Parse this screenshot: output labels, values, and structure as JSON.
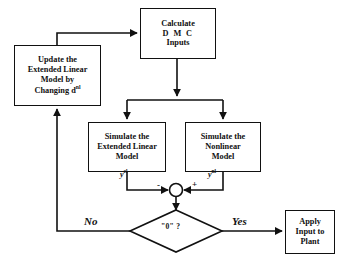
{
  "diagram": {
    "type": "flowchart",
    "line_color": "#111111",
    "background_color": "#ffffff",
    "nodes": {
      "calculate": {
        "shape": "rectangle",
        "lines": [
          "Calculate",
          "D M C",
          "Inputs"
        ]
      },
      "update": {
        "shape": "rectangle",
        "lines": [
          "Update the",
          "Extended Linear",
          "Model by",
          "Changing d"
        ],
        "superscript": "nl"
      },
      "simulate_el": {
        "shape": "rectangle",
        "lines": [
          "Simulate the",
          "Extended Linear",
          "Model"
        ]
      },
      "simulate_nl": {
        "shape": "rectangle",
        "lines": [
          "Simulate the",
          "Nonlinear",
          "Model"
        ]
      },
      "apply": {
        "shape": "rectangle",
        "lines": [
          "Apply",
          "Input to",
          "Plant"
        ]
      },
      "summing_junction": {
        "shape": "circle",
        "left_sign": "-",
        "right_sign": "+"
      },
      "decision": {
        "shape": "diamond",
        "label": "\"0\" ?"
      }
    },
    "edge_labels": {
      "y_extended_linear": "y",
      "y_extended_linear_sup": "el",
      "y_nonlinear": "y",
      "y_nonlinear_sup": "nl",
      "no": "No",
      "yes": "Yes"
    }
  }
}
